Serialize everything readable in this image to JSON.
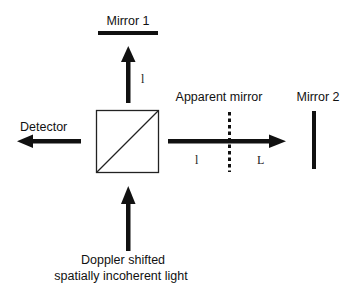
{
  "diagram": {
    "type": "optical-interferometer-schematic",
    "labels": {
      "mirror1": "Mirror 1",
      "mirror2": "Mirror 2",
      "apparent_mirror": "Apparent mirror",
      "detector": "Detector",
      "source_line1": "Doppler shifted",
      "source_line2": "spatially incoherent light",
      "arm1_length": "l",
      "arm2_length_a": "l",
      "arm2_length_b": "L"
    },
    "components": [
      {
        "id": "beam-splitter",
        "shape": "square-with-diagonal"
      },
      {
        "id": "mirror-1",
        "orientation": "horizontal"
      },
      {
        "id": "mirror-2",
        "orientation": "vertical"
      },
      {
        "id": "apparent-mirror",
        "style": "dashed-vertical"
      }
    ],
    "arrows": [
      {
        "id": "source-to-splitter",
        "direction": "up"
      },
      {
        "id": "splitter-to-mirror1",
        "direction": "up"
      },
      {
        "id": "splitter-to-mirror2",
        "direction": "right"
      },
      {
        "id": "splitter-to-detector",
        "direction": "left"
      }
    ],
    "colors": {
      "ink": "#111111",
      "background": "#ffffff"
    }
  }
}
